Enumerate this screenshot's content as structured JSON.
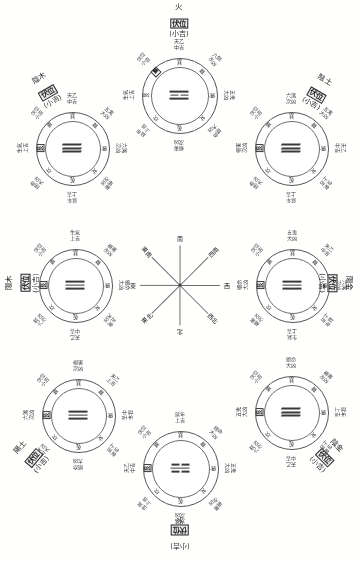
{
  "sheet": {
    "title": "八卦九宮吉凶方位圖",
    "trigram_ring": [
      "巽",
      "離",
      "坤",
      "兌",
      "乾",
      "坎",
      "艮",
      "震"
    ],
    "compass": {
      "center_dot": "●",
      "directions": [
        {
          "label": "南",
          "angle": -90
        },
        {
          "label": "西南",
          "angle": -45
        },
        {
          "label": "西",
          "angle": 0
        },
        {
          "label": "西北",
          "angle": 45
        },
        {
          "label": "北",
          "angle": 90
        },
        {
          "label": "東北",
          "angle": 135
        },
        {
          "label": "東",
          "angle": 180
        },
        {
          "label": "東南",
          "angle": -135
        }
      ]
    },
    "outer_terms": [
      {
        "name": "生氣",
        "grade": "上吉"
      },
      {
        "name": "天乙",
        "grade": "中吉"
      },
      {
        "name": "延年",
        "grade": "上吉"
      },
      {
        "name": "伏位",
        "grade": "小吉"
      },
      {
        "name": "絕命",
        "grade": "大凶"
      },
      {
        "name": "五鬼",
        "grade": "大凶"
      },
      {
        "name": "六煞",
        "grade": "次凶"
      },
      {
        "name": "禍害",
        "grade": "次凶"
      }
    ],
    "wheels": [
      {
        "id": "yin-wood",
        "element": "陰木",
        "palace": "伏位",
        "grade": "(小吉)",
        "trigram_lines": [
          "full",
          "full",
          "full"
        ],
        "style": "slant",
        "marked_ring_index": 6,
        "ring_start_index": 0,
        "outer": [
          {
            "name": "天乙",
            "grade": "中吉"
          },
          {
            "name": "五鬼",
            "grade": "大凶"
          },
          {
            "name": "六煞",
            "grade": "次凶"
          },
          {
            "name": "禍害",
            "grade": "次凶"
          },
          {
            "name": "延年",
            "grade": "上吉"
          },
          {
            "name": "絕命",
            "grade": "大凶"
          },
          {
            "name": "生氣",
            "grade": "上吉"
          },
          {
            "name": "伏位",
            "grade": "小吉"
          }
        ]
      },
      {
        "id": "fire",
        "element": "火",
        "palace": "伏位",
        "grade": "(小吉)",
        "trigram_lines": [
          "full",
          "half",
          "full"
        ],
        "style": "flat",
        "marked_ring_index": 7,
        "ring_start_index": 0,
        "outer": [
          {
            "name": "天乙",
            "grade": "中吉"
          },
          {
            "name": "六煞",
            "grade": "次凶"
          },
          {
            "name": "五鬼",
            "grade": "大凶"
          },
          {
            "name": "絕命",
            "grade": "大凶"
          },
          {
            "name": "禍害",
            "grade": "次凶"
          },
          {
            "name": "延年",
            "grade": "上吉"
          },
          {
            "name": "生氣",
            "grade": "上吉"
          },
          {
            "name": "伏位",
            "grade": "小吉"
          }
        ]
      },
      {
        "id": "yin-earth",
        "element": "陰土",
        "palace": "伏位",
        "grade": "(小吉)",
        "trigram_lines": [
          "full",
          "full",
          "full"
        ],
        "style": "slant",
        "marked_ring_index": 6,
        "ring_start_index": 0,
        "outer": [
          {
            "name": "六煞",
            "grade": "次凶"
          },
          {
            "name": "五鬼",
            "grade": "大凶"
          },
          {
            "name": "天乙",
            "grade": "中吉"
          },
          {
            "name": "生氣",
            "grade": "上吉"
          },
          {
            "name": "延年",
            "grade": "上吉"
          },
          {
            "name": "絕命",
            "grade": "大凶"
          },
          {
            "name": "禍害",
            "grade": "次凶"
          },
          {
            "name": "伏位",
            "grade": "小吉"
          }
        ]
      },
      {
        "id": "yang-wood",
        "element": "陽木",
        "palace": "伏位",
        "grade": "(小吉)",
        "trigram_lines": [
          "full",
          "full",
          "full"
        ],
        "style": "straight",
        "marked_ring_index": 6,
        "ring_start_index": 0,
        "outer": [
          {
            "name": "生氣",
            "grade": "上吉"
          },
          {
            "name": "禍害",
            "grade": "次凶"
          },
          {
            "name": "絕命",
            "grade": "大凶"
          },
          {
            "name": "五鬼",
            "grade": "大凶"
          },
          {
            "name": "天乙",
            "grade": "中吉"
          },
          {
            "name": "六煞",
            "grade": "次凶"
          },
          {
            "name": "延年",
            "grade": "上吉"
          },
          {
            "name": "伏位",
            "grade": "小吉"
          }
        ]
      },
      {
        "id": "yang-metal",
        "element": "陽金",
        "palace": "伏位",
        "grade": "(小吉)",
        "trigram_lines": [
          "full",
          "full",
          "full"
        ],
        "style": "straight",
        "marked_ring_index": 6,
        "ring_start_index": 0,
        "outer": [
          {
            "name": "五鬼",
            "grade": "大凶"
          },
          {
            "name": "天乙",
            "grade": "中吉"
          },
          {
            "name": "六煞",
            "grade": "次凶"
          },
          {
            "name": "延年",
            "grade": "上吉"
          },
          {
            "name": "生氣",
            "grade": "上吉"
          },
          {
            "name": "禍害",
            "grade": "次凶"
          },
          {
            "name": "絕命",
            "grade": "大凶"
          },
          {
            "name": "伏位",
            "grade": "小吉"
          }
        ]
      },
      {
        "id": "yang-earth",
        "element": "陽土",
        "palace": "伏位",
        "grade": "(小吉)",
        "trigram_lines": [
          "full",
          "full",
          "full"
        ],
        "style": "straight",
        "marked_ring_index": 6,
        "ring_start_index": 0,
        "outer": [
          {
            "name": "禍害",
            "grade": "次凶"
          },
          {
            "name": "天乙",
            "grade": "上吉"
          },
          {
            "name": "延年",
            "grade": "中吉"
          },
          {
            "name": "生氣",
            "grade": "上吉"
          },
          {
            "name": "絕命",
            "grade": "大凶"
          },
          {
            "name": "五鬼",
            "grade": "大凶"
          },
          {
            "name": "六煞",
            "grade": "次凶"
          },
          {
            "name": "伏位",
            "grade": "小吉"
          }
        ]
      },
      {
        "id": "water",
        "element": "水",
        "palace": "伏位",
        "grade": "(小吉)",
        "trigram_lines": [
          "half",
          "full",
          "half"
        ],
        "style": "flat",
        "marked_ring_index": 6,
        "ring_start_index": 0,
        "outer": [
          {
            "name": "延年",
            "grade": "上吉"
          },
          {
            "name": "絕命",
            "grade": "大凶"
          },
          {
            "name": "五鬼",
            "grade": "大凶"
          },
          {
            "name": "禍害",
            "grade": "次凶"
          },
          {
            "name": "六煞",
            "grade": "次凶"
          },
          {
            "name": "生氣",
            "grade": "上吉"
          },
          {
            "name": "天乙",
            "grade": "中吉"
          },
          {
            "name": "伏位",
            "grade": "小吉"
          }
        ]
      },
      {
        "id": "yin-metal",
        "element": "陰金",
        "palace": "伏位",
        "grade": "(小吉)",
        "trigram_lines": [
          "full",
          "full",
          "full"
        ],
        "style": "slant",
        "marked_ring_index": 6,
        "ring_start_index": 0,
        "outer": [
          {
            "name": "絕命",
            "grade": "大凶"
          },
          {
            "name": "禍害",
            "grade": "次凶"
          },
          {
            "name": "延年",
            "grade": "上吉"
          },
          {
            "name": "生氣",
            "grade": "上吉"
          },
          {
            "name": "天乙",
            "grade": "中吉"
          },
          {
            "name": "六煞",
            "grade": "次凶"
          },
          {
            "name": "五鬼",
            "grade": "大凶"
          },
          {
            "name": "伏位",
            "grade": "小吉"
          }
        ]
      }
    ]
  }
}
